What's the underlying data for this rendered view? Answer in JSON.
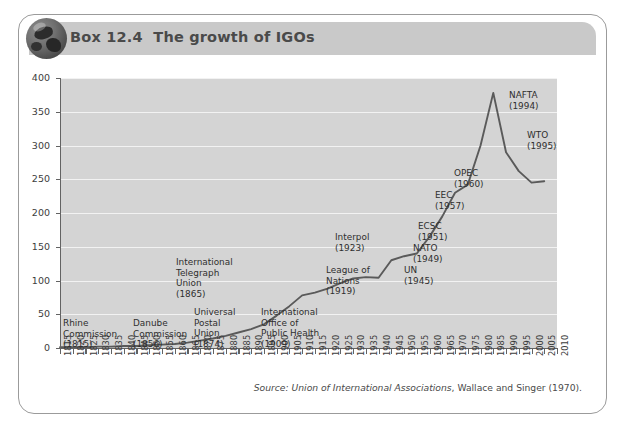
{
  "box": {
    "icon": "globe-icon",
    "title": "Box 12.4  The growth of IGOs"
  },
  "source": {
    "prefix": "Source:",
    "italic_part": "Union of International Associations",
    "rest": ", Wallace and Singer (1970)."
  },
  "colors": {
    "plot_background": "#d4d4d4",
    "gridline": "#f2f2f2",
    "line": "#5a5a5a",
    "axis": "#636363",
    "header_band": "#c9c9c9",
    "box_border": "#9b9b9b",
    "title_text": "#4a4a4a"
  },
  "annotations": [
    {
      "name": "rhine-commission",
      "text": "Rhine\nCommission\n(1815)",
      "x": 34,
      "y": 258,
      "align": "left"
    },
    {
      "name": "danube-commission",
      "text": "Danube\nCommission\n(1856)",
      "x": 104,
      "y": 258,
      "align": "left"
    },
    {
      "name": "universal-postal-union",
      "text": "Universal\nPostal\nUnion\n(1874)",
      "x": 165,
      "y": 247,
      "align": "left"
    },
    {
      "name": "international-telegraph-union",
      "text": "International\nTelegraph\nUnion\n(1865)",
      "x": 147,
      "y": 197,
      "align": "left"
    },
    {
      "name": "international-office-of-public-health",
      "text": "International\nOffice of\nPublic Health\n(1909)",
      "x": 232,
      "y": 247,
      "align": "left"
    },
    {
      "name": "league-of-nations",
      "text": "League of\nNations\n(1919)",
      "x": 297,
      "y": 205,
      "align": "left"
    },
    {
      "name": "interpol",
      "text": "Interpol\n(1923)",
      "x": 306,
      "y": 172,
      "align": "left"
    },
    {
      "name": "un",
      "text": "UN\n(1945)",
      "x": 375,
      "y": 205,
      "align": "left"
    },
    {
      "name": "nato",
      "text": "NATO\n(1949)",
      "x": 384,
      "y": 183,
      "align": "left"
    },
    {
      "name": "ecsc",
      "text": "ECSC\n(1951)",
      "x": 389,
      "y": 161,
      "align": "left"
    },
    {
      "name": "eec",
      "text": "EEC\n(1957)",
      "x": 406,
      "y": 130,
      "align": "left"
    },
    {
      "name": "opec",
      "text": "OPEC\n(1960)",
      "x": 425,
      "y": 108,
      "align": "left"
    },
    {
      "name": "wto",
      "text": "WTO\n(1995)",
      "x": 498,
      "y": 70,
      "align": "left"
    },
    {
      "name": "nafta",
      "text": "NAFTA\n(1994)",
      "x": 480,
      "y": 30,
      "align": "left"
    }
  ],
  "chart_data": {
    "type": "line",
    "title": "Box 12.4  The growth of IGOs",
    "xlabel": "",
    "ylabel": "",
    "ylim": [
      0,
      400
    ],
    "yticks": [
      0,
      50,
      100,
      150,
      200,
      250,
      300,
      350,
      400
    ],
    "xlim": [
      1815,
      2010
    ],
    "grid": "horizontal",
    "legend": "none",
    "xticks": [
      1815,
      1820,
      1825,
      1830,
      1835,
      1840,
      1845,
      1850,
      1855,
      1860,
      1865,
      1870,
      1875,
      1880,
      1885,
      1890,
      1895,
      1900,
      1905,
      1910,
      1915,
      1920,
      1925,
      1930,
      1935,
      1940,
      1945,
      1950,
      1955,
      1960,
      1965,
      1970,
      1975,
      1980,
      1985,
      1990,
      1995,
      2000,
      2005,
      2010
    ],
    "x": [
      1815,
      1820,
      1825,
      1830,
      1835,
      1840,
      1845,
      1850,
      1855,
      1860,
      1865,
      1870,
      1875,
      1880,
      1885,
      1890,
      1895,
      1900,
      1905,
      1910,
      1915,
      1920,
      1925,
      1930,
      1935,
      1940,
      1945,
      1950,
      1955,
      1960,
      1965,
      1970,
      1975,
      1980,
      1985,
      1990,
      1995,
      2000,
      2005
    ],
    "values": [
      1,
      1,
      1,
      2,
      2,
      3,
      3,
      4,
      5,
      6,
      8,
      11,
      14,
      18,
      23,
      28,
      35,
      48,
      62,
      78,
      82,
      88,
      96,
      103,
      105,
      104,
      130,
      136,
      140,
      165,
      195,
      230,
      242,
      300,
      378,
      290,
      262,
      245,
      247
    ],
    "annotations": [
      {
        "label": "Rhine Commission",
        "year": 1815
      },
      {
        "label": "Danube Commission",
        "year": 1856
      },
      {
        "label": "International Telegraph Union",
        "year": 1865
      },
      {
        "label": "Universal Postal Union",
        "year": 1874
      },
      {
        "label": "International Office of Public Health",
        "year": 1909
      },
      {
        "label": "League of Nations",
        "year": 1919
      },
      {
        "label": "Interpol",
        "year": 1923
      },
      {
        "label": "UN",
        "year": 1945
      },
      {
        "label": "NATO",
        "year": 1949
      },
      {
        "label": "ECSC",
        "year": 1951
      },
      {
        "label": "EEC",
        "year": 1957
      },
      {
        "label": "OPEC",
        "year": 1960
      },
      {
        "label": "NAFTA",
        "year": 1994
      },
      {
        "label": "WTO",
        "year": 1995
      }
    ],
    "source": "Source: Union of International Associations, Wallace and Singer (1970)."
  }
}
